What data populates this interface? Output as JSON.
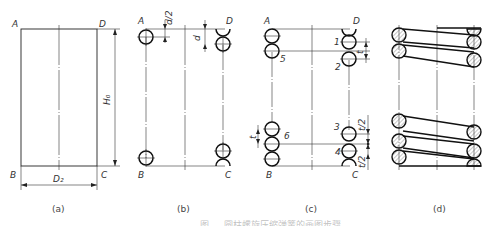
{
  "figure": {
    "panels": [
      {
        "id": "a",
        "caption": "(a)",
        "corners": {
          "A": "A",
          "B": "B",
          "C": "C",
          "D": "D"
        },
        "dims": {
          "height": "H₀",
          "diameter": "D₂"
        }
      },
      {
        "id": "b",
        "caption": "(b)",
        "corners": {
          "A": "A",
          "B": "B",
          "C": "C",
          "D": "D"
        },
        "dims": {
          "half_wire": "d/2",
          "wire": "d"
        }
      },
      {
        "id": "c",
        "caption": "(c)",
        "corners": {
          "A": "A",
          "B": "B",
          "C": "C",
          "D": "D"
        },
        "coil_numbers": [
          "1",
          "2",
          "3",
          "4",
          "5",
          "6"
        ],
        "dims": {
          "pitch_right": "t",
          "pitch_left": "t",
          "half_pitch_top": "t/2",
          "half_pitch_bottom": "t/2"
        }
      },
      {
        "id": "d",
        "caption": "(d)"
      }
    ],
    "bottom_caption": "图 … 圆柱螺旋压缩弹簧的画图步骤"
  }
}
